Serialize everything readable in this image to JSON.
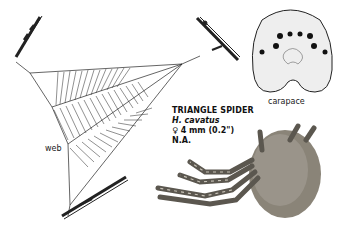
{
  "species": {
    "common_name": "TRIANGLE SPIDER",
    "scientific_name": "H. cavatus",
    "size": "♀ 4 mm (0.2\")",
    "range": "N.A."
  },
  "labels": {
    "web": "web",
    "carapace": "carapace"
  },
  "colors": {
    "background": "#ffffff",
    "ink": "#1a1a1a",
    "spider_body": "#8a8478"
  }
}
